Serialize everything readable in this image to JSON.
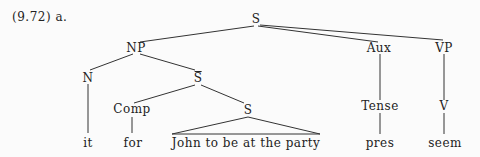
{
  "example_label": "(9.72) a.",
  "tree": {
    "nodes": {
      "S_root": "S",
      "NP": "NP",
      "Aux": "Aux",
      "VP": "VP",
      "N": "N",
      "S_bar": "S",
      "Tense": "Tense",
      "V": "V",
      "Comp": "Comp",
      "S_inner": "S"
    },
    "leaves": {
      "it": "it",
      "for": "for",
      "clause": "John to be at the party",
      "pres": "pres",
      "seem": "seem"
    },
    "edges": [
      [
        "S_root",
        "NP"
      ],
      [
        "S_root",
        "Aux"
      ],
      [
        "S_root",
        "VP"
      ],
      [
        "NP",
        "N"
      ],
      [
        "NP",
        "S_bar"
      ],
      [
        "Aux",
        "Tense"
      ],
      [
        "VP",
        "V"
      ],
      [
        "N",
        "it"
      ],
      [
        "S_bar",
        "Comp"
      ],
      [
        "S_bar",
        "S_inner"
      ],
      [
        "Comp",
        "for"
      ],
      [
        "S_inner",
        "clause (triangle)"
      ],
      [
        "Tense",
        "pres"
      ],
      [
        "V",
        "seem"
      ]
    ]
  }
}
